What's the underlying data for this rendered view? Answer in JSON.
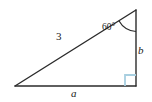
{
  "figure": {
    "name": "right-triangle-diagram",
    "type": "geometry-diagram",
    "background_color": "#ffffff",
    "stroke_color": "#2b2b2b",
    "right_angle_marker_color": "#a8cfe0",
    "labels": {
      "hypotenuse": "3",
      "side_a": "a",
      "side_b": "b",
      "angle": "60°"
    },
    "geometry": {
      "vertices": {
        "left": [
          15,
          86
        ],
        "top_right": [
          136,
          10
        ],
        "bottom_right": [
          136,
          86
        ]
      },
      "right_angle_at": "bottom_right",
      "labeled_angle_at": "top_right",
      "angle_degrees": 60,
      "hypotenuse_length": 3,
      "unknown_sides": [
        "a",
        "b"
      ]
    }
  }
}
